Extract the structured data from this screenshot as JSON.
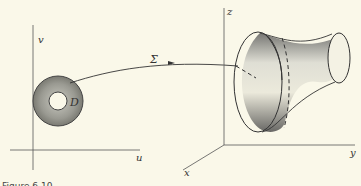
{
  "figure": {
    "left_plane": {
      "axis_u": "u",
      "axis_v": "v",
      "region_label": "D"
    },
    "mapping_label": "Σ",
    "right_space": {
      "axis_x": "x",
      "axis_y": "y",
      "axis_z": "z"
    },
    "caption_partial": "Figure 6.10"
  },
  "colors": {
    "background": "#faf8e9",
    "ink": "#333333",
    "shade": "#8a8a82"
  }
}
